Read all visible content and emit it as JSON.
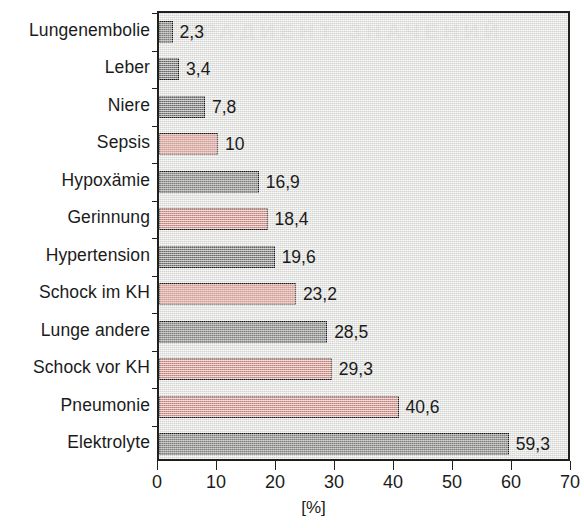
{
  "chart_data": {
    "type": "bar",
    "orientation": "horizontal",
    "title": "",
    "subtitle": "",
    "xlabel": "[%]",
    "ylabel": "",
    "xlim": [
      0,
      70
    ],
    "xticks": [
      0,
      10,
      20,
      30,
      40,
      50,
      60,
      70
    ],
    "xticklabels": [
      "0",
      "10",
      "20",
      "30",
      "40",
      "50",
      "60",
      "70"
    ],
    "grid": false,
    "legend": null,
    "categories": [
      "Lungenembolie",
      "Leber",
      "Niere",
      "Sepsis",
      "Hypoxämie",
      "Gerinnung",
      "Hypertension",
      "Schock im KH",
      "Lunge andere",
      "Schock vor KH",
      "Pneumonie",
      "Elektrolyte"
    ],
    "values": [
      2.3,
      3.4,
      7.8,
      10,
      16.9,
      18.4,
      19.6,
      23.2,
      28.5,
      29.3,
      40.6,
      59.3
    ],
    "value_labels": [
      "2,3",
      "3,4",
      "7,8",
      "10",
      "16,9",
      "18,4",
      "19,6",
      "23,2",
      "28,5",
      "29,3",
      "40,6",
      "59,3"
    ],
    "bar_colors": [
      "gray",
      "gray",
      "gray",
      "red",
      "gray",
      "red",
      "gray",
      "red",
      "gray",
      "red",
      "red",
      "gray"
    ],
    "colors": {
      "gray": "#6f706e",
      "red": "#dd8a80",
      "bar_border": "#1a1a1a",
      "panel_background": "#e3e3e1",
      "axis": "#20201f",
      "text": "#1b1b1b"
    },
    "ghost_text": "ГРАДИЕНТ ЗНАЧЕНИЙ"
  }
}
